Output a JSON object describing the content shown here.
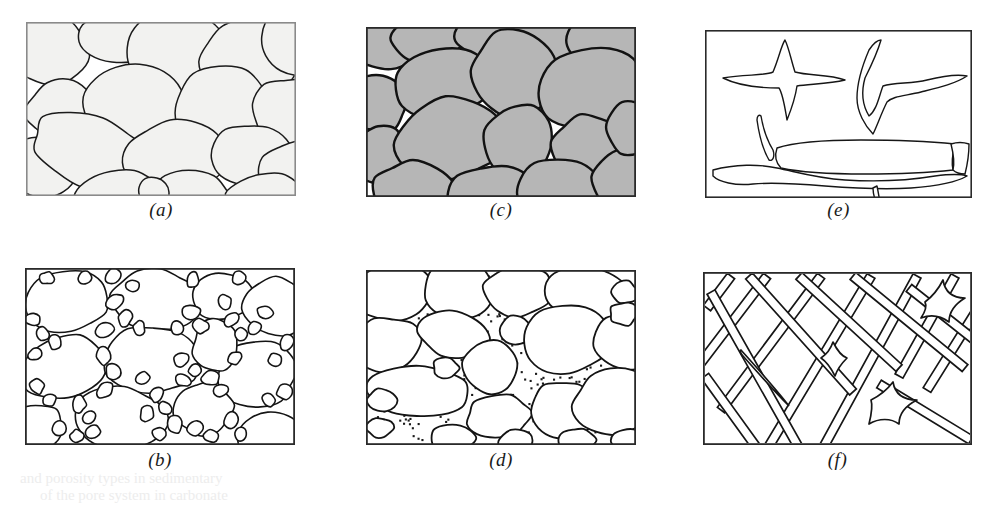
{
  "figure": {
    "background_color": "#ffffff",
    "panel_count": 6,
    "caption_style": "italic-parenthesized-letter"
  },
  "panels": [
    {
      "id": "a",
      "caption": "(a)",
      "description": "Well-sorted rounded grains with intergranular porosity",
      "x": 26,
      "y": 22,
      "width": 270,
      "height": 174,
      "frame_color": "#8a8a8a",
      "frame_width": 1.6,
      "grain_fill": "#f2f2f0",
      "grain_stroke": "#1b1b1b",
      "grain_stroke_width": 1.5,
      "pore_fill": "#ffffff",
      "caption_y": 199
    },
    {
      "id": "b",
      "caption": "(b)",
      "description": "Poorly sorted grains, large grains with small grains filling pores",
      "x": 25,
      "y": 268,
      "width": 270,
      "height": 177,
      "frame_color": "#2a2a2a",
      "frame_width": 1.8,
      "grain_fill": "#ffffff",
      "grain_stroke": "#141414",
      "grain_stroke_width": 1.6,
      "pore_fill": "#ffffff",
      "caption_y": 449
    },
    {
      "id": "c",
      "caption": "(c)",
      "description": "Grains shaded gray with open white intergranular pore space",
      "x": 366,
      "y": 27,
      "width": 270,
      "height": 170,
      "frame_color": "#2a2a2a",
      "frame_width": 1.8,
      "grain_fill": "#b6b6b6",
      "grain_stroke": "#121212",
      "grain_stroke_width": 2.4,
      "pore_fill": "#ffffff",
      "caption_y": 199
    },
    {
      "id": "d",
      "caption": "(d)",
      "description": "Grains floating in a stippled fine matrix",
      "x": 366,
      "y": 270,
      "width": 270,
      "height": 175,
      "frame_color": "#2a2a2a",
      "frame_width": 1.8,
      "grain_fill": "#ffffff",
      "grain_stroke": "#141414",
      "grain_stroke_width": 1.8,
      "pore_fill": "#ffffff",
      "stipple_color": "#1a1a1a",
      "stipple_size": 2.1,
      "caption_y": 449
    },
    {
      "id": "e",
      "caption": "(e)",
      "description": "Irregular vuggy and solution cavity outlines",
      "x": 705,
      "y": 30,
      "width": 267,
      "height": 168,
      "frame_color": "#2a2a2a",
      "frame_width": 1.6,
      "grain_fill": "#ffffff",
      "grain_stroke": "#161616",
      "grain_stroke_width": 1.4,
      "pore_fill": "#ffffff",
      "caption_y": 199
    },
    {
      "id": "f",
      "caption": "(f)",
      "description": "Intersecting straight fracture network channels",
      "x": 703,
      "y": 272,
      "width": 269,
      "height": 173,
      "frame_color": "#2a2a2a",
      "frame_width": 1.8,
      "grain_fill": "#ffffff",
      "grain_stroke": "#161616",
      "grain_stroke_width": 1.7,
      "pore_fill": "#ffffff",
      "caption_y": 449
    }
  ],
  "bleed_through": {
    "visible": true,
    "color": "#ededed",
    "note": "faint illegible reverse-page text at bottom of scan",
    "lines": [
      {
        "text": "and porosity types in sedimentary",
        "x": 20,
        "y": 470,
        "size": 15
      },
      {
        "text": "of the pore system in carbonate",
        "x": 40,
        "y": 487,
        "size": 15
      }
    ]
  },
  "chart_data": {
    "type": "diagram",
    "panel_labels": [
      "(a)",
      "(b)",
      "(c)",
      "(d)",
      "(e)",
      "(f)"
    ],
    "panel_descriptions": [
      "Well-sorted rounded grains, intergranular porosity",
      "Poorly sorted grains, pore space reduced by small grains",
      "Shaded grains with open intergranular pore space",
      "Grains supported by stippled fine-grained matrix",
      "Irregular vug and solution cavity porosity",
      "Fracture porosity network"
    ]
  }
}
